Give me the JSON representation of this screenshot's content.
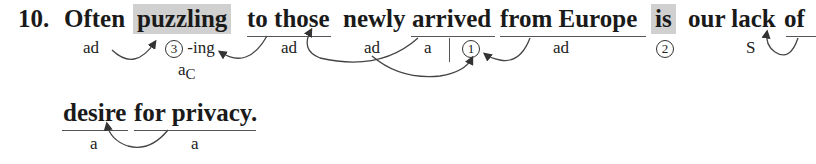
{
  "item_number": "10.",
  "line1": {
    "words": {
      "often": "Often",
      "puzzling": "puzzling",
      "to_those": "to those",
      "newly": "newly",
      "arrived": "arrived",
      "from_europe": "from Europe",
      "is": "is",
      "our_lack": "our lack",
      "of": "of"
    },
    "labels": {
      "often": "ad",
      "puzzling_num": "3",
      "puzzling_suffix": "-ing",
      "puzzling_role": "a",
      "puzzling_role_sub": "C",
      "to_those": "ad",
      "newly": "ad",
      "arrived_a": "a",
      "arrived_num": "1",
      "from_europe": "ad",
      "is_num": "2",
      "our_lack": "S"
    }
  },
  "line2": {
    "words": {
      "desire": "desire",
      "for_privacy": "for privacy."
    },
    "labels": {
      "desire": "a",
      "for_privacy": "a"
    }
  },
  "colors": {
    "highlight": "#d0d0d0",
    "text": "#1a1a1a",
    "lines": "#555555"
  }
}
